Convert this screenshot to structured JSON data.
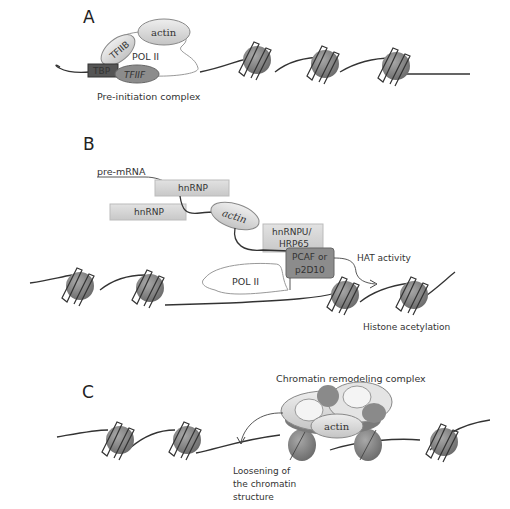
{
  "panels": {
    "A": {
      "letter": "A",
      "proteins": {
        "actin": "actin",
        "tfiib": "TFIIB",
        "pol2": "POL II",
        "tbp": "TBP",
        "tfiif": "TFIIF"
      },
      "caption": "Pre-initiation complex"
    },
    "B": {
      "letter": "B",
      "pre_mrna": "pre-mRNA",
      "hnrnp_1": "hnRNP",
      "hnrnp_2": "hnRNP",
      "actin": "actin",
      "hnrnpu_line1": "hnRNPU/",
      "hnrnpu_line2": "HRP65",
      "pcaf_line1": "PCAF or",
      "pcaf_line2": "p2D10",
      "pol2": "POL II",
      "hat": "HAT activity",
      "acetylation": "Histone acetylation"
    },
    "C": {
      "letter": "C",
      "complex_label": "Chromatin remodeling complex",
      "actin": "actin",
      "loosening_line1": "Loosening of",
      "loosening_line2": "the chromatin",
      "loosening_line3": "structure"
    }
  },
  "colors": {
    "nucleosome": "#8a8a8a",
    "dark_box": "#555555",
    "mid_box": "#8c8c8c",
    "light_box": "#d0d0d0",
    "ellipse_fill": "#dcdcdc"
  }
}
